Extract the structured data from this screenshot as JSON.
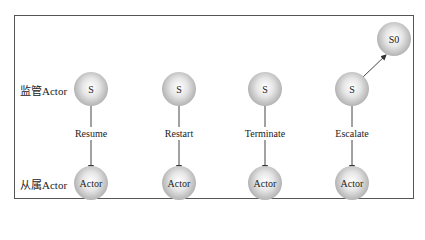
{
  "row_labels": {
    "supervisor": "监管Actor",
    "subordinate": "从属Actor"
  },
  "columns": [
    {
      "strategy": "Resume",
      "supervisor": "S",
      "subordinate": "Actor"
    },
    {
      "strategy": "Restart",
      "supervisor": "S",
      "subordinate": "Actor"
    },
    {
      "strategy": "Terminate",
      "supervisor": "S",
      "subordinate": "Actor"
    },
    {
      "strategy": "Escalate",
      "supervisor": "S",
      "subordinate": "Actor",
      "parent": "S0"
    }
  ]
}
